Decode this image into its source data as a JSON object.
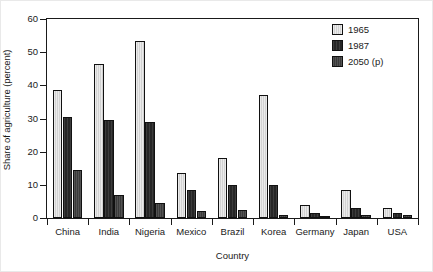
{
  "chart_data": {
    "type": "bar",
    "title": "",
    "xlabel": "Country",
    "ylabel": "Share of agriculture (percent)",
    "ylim": [
      0,
      60
    ],
    "yticks": [
      0,
      10,
      20,
      30,
      40,
      50,
      60
    ],
    "grid": false,
    "legend_position": "top-right",
    "categories": [
      "China",
      "India",
      "Nigeria",
      "Mexico",
      "Brazil",
      "Korea",
      "Germany",
      "Japan",
      "USA"
    ],
    "series": [
      {
        "name": "1965",
        "color": "#d2d2d2",
        "values": [
          38.5,
          46.5,
          53.5,
          13.5,
          18.0,
          37.0,
          4.0,
          8.5,
          3.0
        ]
      },
      {
        "name": "1987",
        "color": "#262626",
        "values": [
          30.5,
          29.5,
          29.0,
          8.5,
          10.0,
          10.0,
          1.5,
          3.0,
          1.5
        ]
      },
      {
        "name": "2050 (p)",
        "color": "#3a3a3a",
        "values": [
          14.5,
          7.0,
          4.5,
          2.0,
          2.5,
          1.0,
          0.7,
          1.0,
          0.8
        ]
      }
    ]
  },
  "axes": {
    "y_tick_labels": [
      "0",
      "10",
      "20",
      "30",
      "40",
      "50",
      "60"
    ],
    "y_axis_title": "Share of agriculture (percent)",
    "x_axis_title": "Country"
  },
  "legend": {
    "entries": [
      {
        "label": "1965",
        "swatch": "legend-swatch-1965"
      },
      {
        "label": "1987",
        "swatch": "legend-swatch-1987"
      },
      {
        "label": "2050 (p)",
        "swatch": "legend-swatch-2050"
      }
    ]
  }
}
